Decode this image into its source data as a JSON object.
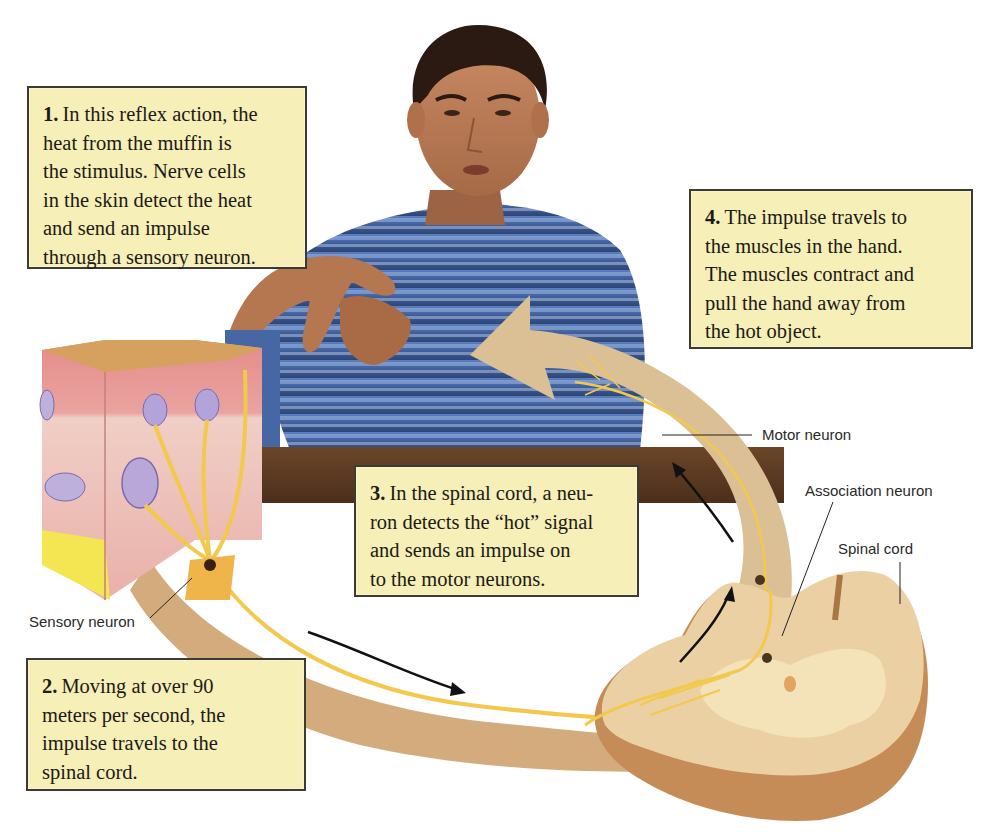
{
  "figure": {
    "colors": {
      "caption_bg": "#f6efb7",
      "caption_border": "#3b3a33",
      "nerve_tan": "#d9b888",
      "nerve_fiber": "#f2c94c",
      "skin_pink": "#e9a7a4",
      "desk_brown": "#5a3a22",
      "shirt_blue": "#4a6ea8"
    }
  },
  "captions": [
    {
      "number": "1.",
      "lines": [
        "In this reflex action, the",
        "heat from the muffin is",
        "the stimulus. Nerve cells",
        "in the skin detect the heat",
        "and send an impulse",
        "through a sensory neuron."
      ]
    },
    {
      "number": "2.",
      "lines": [
        "Moving at over 90",
        "meters per second, the",
        "impulse travels to the",
        "spinal cord."
      ]
    },
    {
      "number": "3.",
      "lines": [
        "In the spinal cord, a neu-",
        "ron detects the “hot” signal",
        "and sends an impulse on",
        "to the motor neurons."
      ]
    },
    {
      "number": "4.",
      "lines": [
        "The impulse travels to",
        "the muscles in the hand.",
        "The muscles contract and",
        "pull the hand away from",
        "the hot object."
      ]
    }
  ],
  "labels": {
    "sensory_neuron": "Sensory neuron",
    "motor_neuron": "Motor neuron",
    "association_neuron": "Association neuron",
    "spinal_cord": "Spinal cord"
  },
  "icons": {
    "impulse_arrow_sensory": "arrow-right-curved",
    "impulse_arrow_spinal": "arrow-up-curved",
    "impulse_arrow_motor": "arrow-up-left",
    "motor_pathway_arrowhead": "large-arrowhead"
  }
}
